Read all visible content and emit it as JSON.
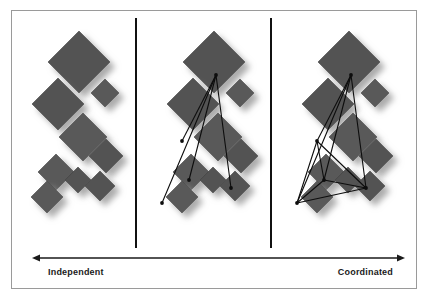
{
  "figure": {
    "name": "coordination-spectrum-diagram",
    "width": 427,
    "height": 298,
    "background_color": "#ffffff",
    "frame": {
      "x": 11,
      "y": 10,
      "width": 405,
      "height": 278,
      "border_color": "#9a9a9a",
      "fill_color": "#ffffff"
    }
  },
  "colors": {
    "diamond_fill": "#585858",
    "diamond_fill_alt": "#5e5e5e",
    "diamond_edge": "#4a4a4a",
    "shadow": "#b8b8b8",
    "divider": "#111111",
    "connector": "#0d0d0d",
    "axis": "#1a1a1a",
    "label_text": "#1a1a1a",
    "frame_border": "#9a9a9a"
  },
  "dividers": [
    {
      "name": "divider-1",
      "x": 136,
      "y1": 18,
      "y2": 248
    },
    {
      "name": "divider-2",
      "x": 271,
      "y1": 18,
      "y2": 248
    }
  ],
  "axis": {
    "name": "independent-coordinated-axis",
    "y": 258,
    "x1": 32,
    "x2": 405,
    "double_headed": true,
    "left_label": "Independent",
    "right_label": "Coordinated",
    "left_label_x": 48,
    "right_label_x": 393,
    "label_y": 275
  },
  "panels": [
    {
      "name": "panel-independent",
      "index": 0,
      "offset_x": 0,
      "topology": "none",
      "edges": []
    },
    {
      "name": "panel-partial-coordination",
      "index": 1,
      "offset_x": 135,
      "topology": "star",
      "edges": [
        [
          0,
          1
        ],
        [
          0,
          2
        ],
        [
          0,
          3
        ],
        [
          0,
          4
        ]
      ]
    },
    {
      "name": "panel-coordinated",
      "index": 2,
      "offset_x": 270,
      "topology": "full-mesh",
      "edges": [
        [
          0,
          1
        ],
        [
          0,
          2
        ],
        [
          0,
          3
        ],
        [
          0,
          4
        ],
        [
          1,
          2
        ],
        [
          1,
          3
        ],
        [
          1,
          4
        ],
        [
          2,
          3
        ],
        [
          2,
          4
        ],
        [
          3,
          4
        ]
      ]
    }
  ],
  "diamonds": [
    {
      "name": "node-top-large",
      "cx": 79,
      "cy": 62,
      "size": 31
    },
    {
      "name": "node-upper-right",
      "cx": 105,
      "cy": 93,
      "size": 14
    },
    {
      "name": "node-mid-left",
      "cx": 58,
      "cy": 104,
      "size": 26
    },
    {
      "name": "node-mid-center",
      "cx": 83,
      "cy": 137,
      "size": 24
    },
    {
      "name": "node-mid-right",
      "cx": 106,
      "cy": 156,
      "size": 17
    },
    {
      "name": "node-lower-left",
      "cx": 56,
      "cy": 172,
      "size": 18
    },
    {
      "name": "node-lower-center",
      "cx": 78,
      "cy": 180,
      "size": 13
    },
    {
      "name": "node-bottom-left",
      "cx": 47,
      "cy": 197,
      "size": 16
    },
    {
      "name": "node-bottom-right",
      "cx": 100,
      "cy": 186,
      "size": 15
    }
  ],
  "connector_nodes": [
    {
      "name": "hub-node",
      "x": 81,
      "y": 75,
      "label_index": 0
    },
    {
      "name": "spoke-node-left",
      "x": 47,
      "y": 141,
      "label_index": 1
    },
    {
      "name": "spoke-node-mid",
      "x": 54,
      "y": 180,
      "label_index": 2
    },
    {
      "name": "spoke-node-low",
      "x": 27,
      "y": 203,
      "label_index": 3
    },
    {
      "name": "spoke-node-right",
      "x": 96,
      "y": 188,
      "label_index": 4
    }
  ]
}
